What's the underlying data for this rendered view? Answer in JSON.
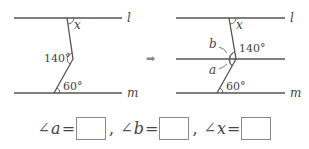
{
  "diagram": {
    "left": {
      "lines": [
        {
          "label": "l"
        },
        {
          "label": "m"
        }
      ],
      "angles": {
        "x": "x",
        "middle": "140°",
        "bottom": "60°"
      }
    },
    "arrow": "➡",
    "right": {
      "lines": [
        {
          "label": "l"
        },
        {
          "label": "m"
        }
      ],
      "angles": {
        "x": "x",
        "middle": "140°",
        "bottom": "60°",
        "a": "a",
        "b": "b"
      }
    },
    "colors": {
      "line": "#555555",
      "arrow": "#888888"
    }
  },
  "answers": [
    {
      "angle_symbol": "∠",
      "var": "a",
      "equals": "=",
      "value": "",
      "separator": ","
    },
    {
      "angle_symbol": "∠",
      "var": "b",
      "equals": "=",
      "value": "",
      "separator": ","
    },
    {
      "angle_symbol": "∠",
      "var": "x",
      "equals": "=",
      "value": ""
    }
  ]
}
